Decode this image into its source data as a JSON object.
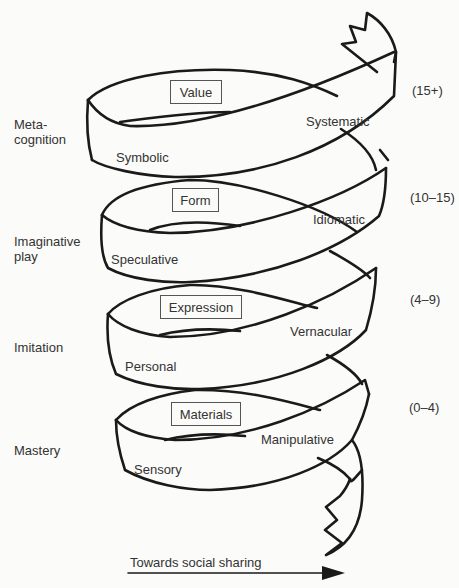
{
  "diagram": {
    "type": "spiral",
    "stages": [
      {
        "level": "Metacognition",
        "level_lines": [
          "Meta-",
          "cognition"
        ],
        "box": "Value",
        "front_label": "Symbolic",
        "back_label": "Systematic",
        "age": "(15+)"
      },
      {
        "level": "Imaginative play",
        "level_lines": [
          "Imaginative",
          "play"
        ],
        "box": "Form",
        "front_label": "Speculative",
        "back_label": "Idiomatic",
        "age": "(10–15)"
      },
      {
        "level": "Imitation",
        "level_lines": [
          "Imitation"
        ],
        "box": "Expression",
        "front_label": "Personal",
        "back_label": "Vernacular",
        "age": "(4–9)"
      },
      {
        "level": "Mastery",
        "level_lines": [
          "Mastery"
        ],
        "box": "Materials",
        "front_label": "Sensory",
        "back_label": "Manipulative",
        "age": "(0–4)"
      }
    ],
    "arrow_label": "Towards social sharing",
    "colors": {
      "line": "#1a1a1a",
      "background": "#fbfbf9",
      "text": "#333333"
    }
  }
}
